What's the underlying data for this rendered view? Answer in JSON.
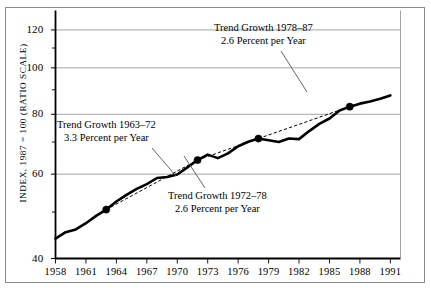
{
  "chart_data": {
    "type": "line",
    "title": "",
    "xlabel": "",
    "ylabel": "INDEX, 1987 = 100 (RATIO SCALE)",
    "scale": "log",
    "grid": true,
    "legend": "none",
    "xlim": [
      1958,
      1992
    ],
    "ylim": [
      40,
      128
    ],
    "xticks": [
      "1958",
      "1961",
      "1964",
      "1967",
      "1970",
      "1973",
      "1976",
      "1979",
      "1982",
      "1985",
      "1988",
      "1991"
    ],
    "xtick_values": [
      1958,
      1961,
      1964,
      1967,
      1970,
      1973,
      1976,
      1979,
      1982,
      1985,
      1988,
      1991
    ],
    "yticks": [
      "40",
      "60",
      "80",
      "100",
      "120"
    ],
    "ytick_values": [
      40,
      60,
      80,
      100,
      120
    ],
    "yminor_values": [
      50,
      70,
      90,
      110
    ],
    "series": [
      {
        "name": "Output per hour index",
        "type": "line",
        "x": [
          1958,
          1959,
          1960,
          1961,
          1962,
          1963,
          1964,
          1965,
          1966,
          1967,
          1968,
          1969,
          1970,
          1971,
          1972,
          1973,
          1974,
          1975,
          1976,
          1977,
          1978,
          1979,
          1980,
          1981,
          1982,
          1983,
          1984,
          1985,
          1986,
          1987,
          1988,
          1989,
          1990,
          1991
        ],
        "values": [
          44.0,
          45.4,
          46.0,
          47.4,
          49.1,
          50.6,
          52.6,
          54.3,
          55.9,
          57.2,
          58.9,
          59.2,
          59.9,
          62.0,
          64.2,
          65.9,
          64.8,
          66.3,
          68.6,
          70.1,
          71.2,
          70.6,
          70.0,
          71.2,
          71.0,
          73.8,
          76.4,
          78.4,
          81.5,
          83.0,
          84.2,
          85.1,
          86.2,
          87.6
        ]
      }
    ],
    "trend_segments": [
      {
        "name": "Trend Growth 1963-72",
        "start_year": 1963,
        "end_year": 1972,
        "start_value": 50.6,
        "end_value": 64.2,
        "rate_percent_per_year": 3.3,
        "style": "dashed"
      },
      {
        "name": "Trend Growth 1972-78",
        "start_year": 1972,
        "end_year": 1978,
        "start_value": 64.2,
        "end_value": 71.2,
        "rate_percent_per_year": 2.6,
        "style": "dashed"
      },
      {
        "name": "Trend Growth 1978-87",
        "start_year": 1978,
        "end_year": 1987,
        "start_value": 71.2,
        "end_value": 83.0,
        "rate_percent_per_year": 2.6,
        "style": "dashed"
      }
    ],
    "markers": [
      {
        "year": 1963,
        "value": 50.6
      },
      {
        "year": 1972,
        "value": 64.2
      },
      {
        "year": 1978,
        "value": 71.2
      },
      {
        "year": 1987,
        "value": 83.0
      }
    ],
    "annotations": [
      {
        "id": "annot-1963-72",
        "line1": "Trend Growth 1963–72",
        "line2": "3.3 Percent per Year"
      },
      {
        "id": "annot-1972-78",
        "line1": "Trend Growth 1972–78",
        "line2": "2.6 Percent per Year"
      },
      {
        "id": "annot-1978-87",
        "line1": "Trend Growth 1978–87",
        "line2": "2.6 Percent per Year"
      }
    ]
  },
  "colors": {
    "series_line": "#000000",
    "trend_line": "#000000",
    "gridline": "#9a9a9a",
    "axis": "#000000",
    "frame": "#8a8a8a",
    "text": "#000000"
  }
}
